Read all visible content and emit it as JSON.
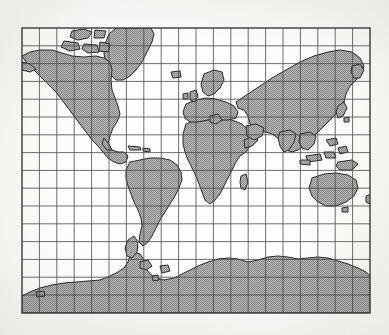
{
  "figure": {
    "kind": "world-map",
    "style": "scanned black and white line art, gray halftone land fill",
    "background_color": "#fbfbf9"
  },
  "frame": {
    "x": 22,
    "y": 28,
    "width": 348,
    "height": 285,
    "border_color": "#3b3b3b",
    "border_width": 1.4
  },
  "graticule": {
    "columns": 20,
    "rows": 16,
    "cell_width": 17.4,
    "cell_height": 17.8,
    "line_color": "#4a4a4a",
    "line_width": 0.8,
    "description": "regular rectangular grid of meridians and parallels"
  },
  "land": {
    "fill_color": "#a9a9a9",
    "outline_color": "#2a2a2a",
    "outline_width": 1.0,
    "texture": "halftone-dither"
  },
  "landmasses": [
    {
      "name": "north-america",
      "label": "North America"
    },
    {
      "name": "greenland",
      "label": "Greenland"
    },
    {
      "name": "iceland",
      "label": "Iceland"
    },
    {
      "name": "canadian-arctic-islands",
      "label": "Canadian Arctic Archipelago"
    },
    {
      "name": "south-america",
      "label": "South America"
    },
    {
      "name": "africa",
      "label": "Africa"
    },
    {
      "name": "europe",
      "label": "Europe"
    },
    {
      "name": "british-isles",
      "label": "British Isles"
    },
    {
      "name": "scandinavia",
      "label": "Scandinavia"
    },
    {
      "name": "asia",
      "label": "Asia"
    },
    {
      "name": "india",
      "label": "Indian Subcontinent"
    },
    {
      "name": "arabia",
      "label": "Arabian Peninsula"
    },
    {
      "name": "japan",
      "label": "Japan"
    },
    {
      "name": "southeast-asia-islands",
      "label": "Indonesia and Philippines"
    },
    {
      "name": "australia",
      "label": "Australia"
    },
    {
      "name": "new-guinea",
      "label": "New Guinea"
    },
    {
      "name": "new-zealand",
      "label": "New Zealand"
    },
    {
      "name": "madagascar",
      "label": "Madagascar"
    },
    {
      "name": "antarctica",
      "label": "Antarctica"
    },
    {
      "name": "antarctic-peninsula",
      "label": "Antarctic Peninsula"
    }
  ]
}
